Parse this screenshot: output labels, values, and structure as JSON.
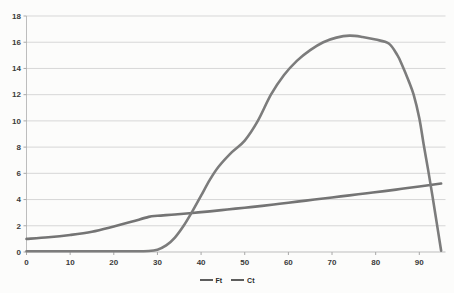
{
  "chart_data": {
    "type": "line",
    "title": "",
    "xlabel": "",
    "ylabel": "",
    "xlim": [
      0,
      96
    ],
    "ylim": [
      0,
      18
    ],
    "x_ticks": [
      0,
      10,
      20,
      30,
      40,
      50,
      60,
      70,
      80,
      90
    ],
    "y_ticks": [
      0,
      2,
      4,
      6,
      8,
      10,
      12,
      14,
      16,
      18
    ],
    "grid": "horizontal",
    "legend_position": "bottom-center",
    "colors": {
      "grid": "#d7d7d7",
      "axis": "#bdbdbd",
      "tick": "#a8a8a8",
      "tick_label": "#3a3a3a",
      "legend_swatch": "#5d5d5d",
      "background": "#fcfcfb"
    },
    "series": [
      {
        "name": "Ft",
        "color": "#747474",
        "points": [
          [
            0,
            1.0
          ],
          [
            5,
            1.12
          ],
          [
            10,
            1.3
          ],
          [
            15,
            1.55
          ],
          [
            20,
            1.95
          ],
          [
            24,
            2.3
          ],
          [
            28,
            2.68
          ],
          [
            30,
            2.76
          ],
          [
            34,
            2.86
          ],
          [
            38,
            2.98
          ],
          [
            42,
            3.1
          ],
          [
            46,
            3.24
          ],
          [
            50,
            3.38
          ],
          [
            54,
            3.52
          ],
          [
            58,
            3.68
          ],
          [
            62,
            3.84
          ],
          [
            66,
            4.0
          ],
          [
            70,
            4.16
          ],
          [
            74,
            4.32
          ],
          [
            78,
            4.48
          ],
          [
            82,
            4.64
          ],
          [
            86,
            4.82
          ],
          [
            90,
            5.0
          ],
          [
            95,
            5.22
          ]
        ]
      },
      {
        "name": "Ct",
        "color": "#7c7c7c",
        "points": [
          [
            0,
            0.06
          ],
          [
            6,
            0.06
          ],
          [
            12,
            0.06
          ],
          [
            18,
            0.06
          ],
          [
            24,
            0.06
          ],
          [
            28,
            0.08
          ],
          [
            30,
            0.18
          ],
          [
            32,
            0.5
          ],
          [
            34,
            1.1
          ],
          [
            36,
            2.0
          ],
          [
            38,
            3.1
          ],
          [
            40,
            4.3
          ],
          [
            42,
            5.5
          ],
          [
            44,
            6.5
          ],
          [
            47,
            7.6
          ],
          [
            50,
            8.5
          ],
          [
            53,
            10.0
          ],
          [
            56,
            12.0
          ],
          [
            59,
            13.5
          ],
          [
            62,
            14.6
          ],
          [
            65,
            15.4
          ],
          [
            68,
            16.0
          ],
          [
            71,
            16.35
          ],
          [
            74,
            16.5
          ],
          [
            77,
            16.4
          ],
          [
            80,
            16.2
          ],
          [
            83,
            15.9
          ],
          [
            85,
            15.0
          ],
          [
            86,
            14.3
          ],
          [
            87.5,
            13.1
          ],
          [
            88.7,
            12.0
          ],
          [
            90,
            10.2
          ],
          [
            91,
            8.2
          ],
          [
            92,
            6.3
          ],
          [
            93,
            4.3
          ],
          [
            94,
            2.2
          ],
          [
            95,
            0.1
          ]
        ]
      }
    ]
  },
  "legend": {
    "items": [
      {
        "label": "Ft"
      },
      {
        "label": "Ct"
      }
    ]
  }
}
